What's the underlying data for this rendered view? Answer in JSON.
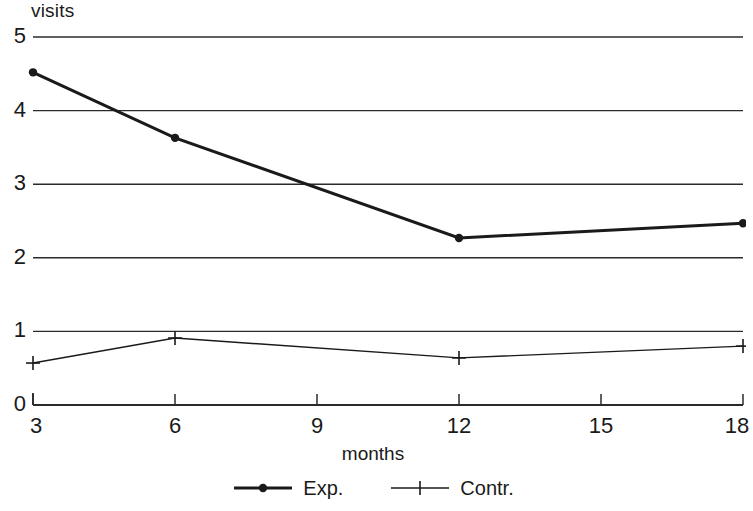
{
  "chart_data": {
    "type": "line",
    "title": "",
    "xlabel": "months",
    "ylabel": "visits",
    "xlim": [
      3,
      18
    ],
    "ylim": [
      0,
      5
    ],
    "grid": "horizontal",
    "legend_position": "bottom-center",
    "x_ticks": [
      "3",
      "6",
      "9",
      "12",
      "15",
      "18"
    ],
    "y_ticks": [
      "0",
      "1",
      "2",
      "3",
      "4",
      "5"
    ],
    "x": [
      3,
      6,
      12,
      18
    ],
    "series": [
      {
        "name": "Exp.",
        "marker": "filled-circle",
        "line_width": 3,
        "color": "#1a1a1a",
        "values": [
          4.52,
          3.63,
          2.27,
          2.47
        ]
      },
      {
        "name": "Contr.",
        "marker": "plus",
        "line_width": 1.4,
        "color": "#1a1a1a",
        "values": [
          0.57,
          0.91,
          0.64,
          0.8
        ]
      }
    ]
  },
  "axes": {
    "y_title": "visits",
    "x_title": "months"
  },
  "legend": {
    "entries": [
      {
        "label": "Exp."
      },
      {
        "label": "Contr."
      }
    ]
  }
}
